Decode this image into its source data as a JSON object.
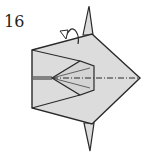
{
  "diagram": {
    "step_number": "16",
    "colors": {
      "paper": "#dcdcdc",
      "line": "#2a2a2a",
      "background": "#ffffff"
    },
    "symbols": [
      "mountain-fold-line",
      "fold-behind-arrow"
    ]
  }
}
